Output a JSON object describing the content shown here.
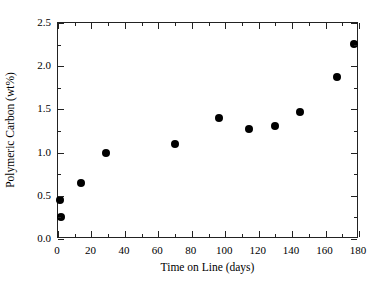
{
  "chart_data": {
    "type": "scatter",
    "title": "",
    "xlabel": "Time on Line (days)",
    "ylabel": "Polymeric Carbon (wt%)",
    "xlim": [
      0,
      180
    ],
    "ylim": [
      0.0,
      2.5
    ],
    "grid": false,
    "legend": null,
    "marker": {
      "shape": "circle",
      "color": "#000000",
      "size_px": 8
    },
    "xticks": [
      0,
      20,
      40,
      60,
      80,
      100,
      120,
      140,
      160,
      180
    ],
    "xticklabels": [
      "0",
      "20",
      "40",
      "60",
      "80",
      "100",
      "120",
      "140",
      "160",
      "180"
    ],
    "xminor_ticks": [
      10,
      30,
      50,
      70,
      90,
      110,
      130,
      150,
      170
    ],
    "yticks": [
      0.0,
      0.5,
      1.0,
      1.5,
      2.0,
      2.5
    ],
    "yticklabels": [
      "0.0",
      "0.5",
      "1.0",
      "1.5",
      "2.0",
      "2.5"
    ],
    "yminor_ticks": [
      0.25,
      0.75,
      1.25,
      1.75,
      2.25
    ],
    "points": [
      {
        "x": 1,
        "y": 0.45
      },
      {
        "x": 2,
        "y": 0.25
      },
      {
        "x": 14,
        "y": 0.65
      },
      {
        "x": 29,
        "y": 1.0
      },
      {
        "x": 70,
        "y": 1.1
      },
      {
        "x": 96,
        "y": 1.4
      },
      {
        "x": 114,
        "y": 1.27
      },
      {
        "x": 130,
        "y": 1.31
      },
      {
        "x": 145,
        "y": 1.47
      },
      {
        "x": 167,
        "y": 1.87
      },
      {
        "x": 177,
        "y": 2.26
      }
    ],
    "x": [
      1,
      2,
      14,
      29,
      70,
      96,
      114,
      130,
      145,
      167,
      177
    ],
    "values": [
      0.45,
      0.25,
      0.65,
      1.0,
      1.1,
      1.4,
      1.27,
      1.31,
      1.47,
      1.87,
      2.26
    ]
  },
  "colors": {
    "axis": "#222222",
    "marker": "#000000",
    "background": "#ffffff"
  }
}
